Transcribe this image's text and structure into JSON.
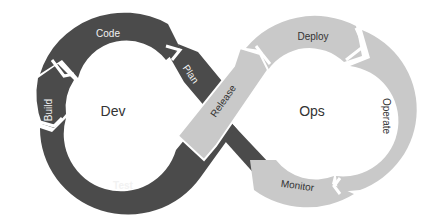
{
  "diagram": {
    "type": "devops-infinity-loop",
    "colors": {
      "dev_loop": "#4b4b4b",
      "ops_loop": "#c9c9c9",
      "separator": "#ffffff",
      "background": "#ffffff"
    },
    "dev": {
      "label": "Dev",
      "stages": [
        {
          "id": "plan",
          "label": "Plan"
        },
        {
          "id": "code",
          "label": "Code"
        },
        {
          "id": "build",
          "label": "Build"
        },
        {
          "id": "test",
          "label": "Test"
        }
      ]
    },
    "ops": {
      "label": "Ops",
      "stages": [
        {
          "id": "release",
          "label": "Release"
        },
        {
          "id": "deploy",
          "label": "Deploy"
        },
        {
          "id": "operate",
          "label": "Operate"
        },
        {
          "id": "monitor",
          "label": "Monitor"
        }
      ]
    }
  }
}
